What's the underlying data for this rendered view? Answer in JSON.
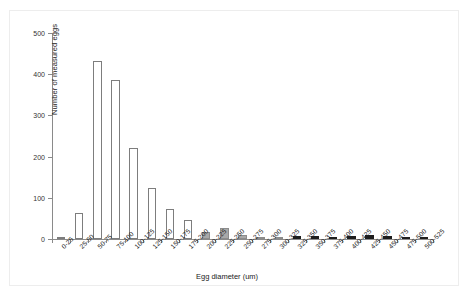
{
  "chart_data": {
    "type": "bar",
    "title": "",
    "xlabel": "Egg diameter (um)",
    "ylabel": "Number of measured eggs",
    "ylim": [
      0,
      500
    ],
    "ytick_labels": [
      "0",
      "100",
      "200",
      "300",
      "400",
      "500"
    ],
    "yticks": [
      0,
      100,
      200,
      300,
      400,
      500
    ],
    "grid": false,
    "legend": false,
    "categories": [
      "0-25",
      "25-50",
      "50-75",
      "75-100",
      "100-125",
      "125-150",
      "150-175",
      "175-200",
      "200-225",
      "225-250",
      "250-275",
      "275-300",
      "300-325",
      "325-350",
      "350-375",
      "375-400",
      "400-425",
      "425-450",
      "450-475",
      "475-500",
      "500-525"
    ],
    "values": [
      1,
      63,
      431,
      387,
      220,
      123,
      72,
      47,
      17,
      27,
      10,
      3,
      4,
      7,
      7,
      6,
      8,
      9,
      8,
      4,
      1
    ],
    "bar_styles": [
      "open",
      "open",
      "open",
      "open",
      "open",
      "open",
      "open",
      "open",
      "gray",
      "gray",
      "gray",
      "gray",
      "gray",
      "dark",
      "dark",
      "dark",
      "dark",
      "dark",
      "dark",
      "dark",
      "dark"
    ]
  },
  "colors": {
    "bar_open_fill": "#ffffff",
    "bar_open_stroke": "#7d7d7d",
    "bar_gray_fill": "#a8a8a8",
    "bar_dark_fill": "#1d1d1d",
    "axis": "#8a8a8a",
    "text": "#222222",
    "background": "#ffffff"
  }
}
